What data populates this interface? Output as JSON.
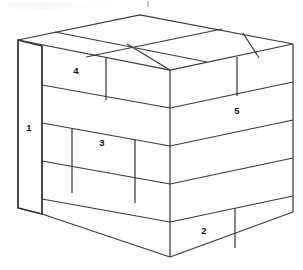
{
  "figure": {
    "title": "Isometric stacked block diagram",
    "background_color": "#ffffff",
    "line_color": "#3a3a3a",
    "fill_color": "#ffffff",
    "label_color": "#111111",
    "labels": [
      {
        "id": "label-1",
        "text": "1",
        "face": "left-side",
        "x": 29,
        "y": 128
      },
      {
        "id": "label-2",
        "text": "2",
        "face": "front-right",
        "x": 204,
        "y": 231
      },
      {
        "id": "label-3",
        "text": "3",
        "face": "front-left",
        "x": 102,
        "y": 143
      },
      {
        "id": "label-4",
        "text": "4",
        "face": "front-left",
        "x": 76,
        "y": 71
      },
      {
        "id": "label-5",
        "text": "5",
        "face": "front-right",
        "x": 237,
        "y": 111
      }
    ],
    "artifact": {
      "top_smudge": "faint scanned header remnant",
      "top_tick": "faint mark"
    }
  },
  "geometry": {
    "vertices": {
      "top_back_left": [
        18,
        40
      ],
      "top_back_apex": [
        140,
        15
      ],
      "top_back_right": [
        293,
        44
      ],
      "top_front_center": [
        170,
        70
      ],
      "left_face_front_top": [
        42,
        46
      ],
      "left_face_front_bottom": [
        42,
        214
      ],
      "bottom_left": [
        18,
        208
      ],
      "bottom_front_center": [
        170,
        257
      ],
      "bottom_right": [
        293,
        212
      ]
    },
    "courses": 5,
    "projection": "isometric"
  }
}
